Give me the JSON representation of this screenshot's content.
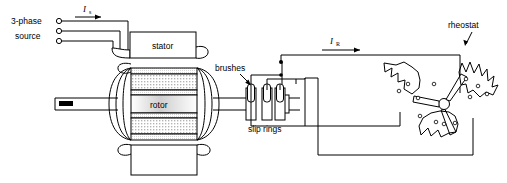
{
  "diagram": {
    "background_color": "#ffffff",
    "line_color": "#000000"
  },
  "source": {
    "label_line1": "3-phase",
    "label_line2": "source",
    "terminal_count": 3
  },
  "currents": [
    {
      "name": "stator-current",
      "symbol": "I",
      "subscript": "s"
    },
    {
      "name": "rotor-current",
      "symbol": "I",
      "subscript": "R"
    }
  ],
  "machine": {
    "stator_label": "stator",
    "rotor_label": "rotor",
    "base_label": ""
  },
  "brushes": {
    "label": "brushes",
    "count": 3
  },
  "slip_rings": {
    "label": "slip rings",
    "count": 3
  },
  "rheostat": {
    "label": "rheostat",
    "arm_count": 3,
    "tap_count": 9
  }
}
